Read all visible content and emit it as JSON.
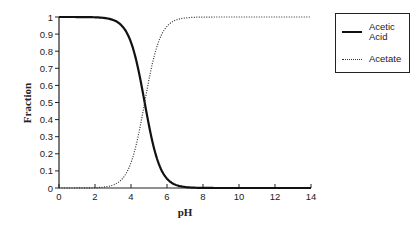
{
  "chart_data": {
    "type": "line",
    "title": "",
    "xlabel": "pH",
    "ylabel": "Fraction",
    "xlim": [
      0,
      14
    ],
    "ylim": [
      0,
      1
    ],
    "xticks": [
      "0",
      "2",
      "4",
      "6",
      "8",
      "10",
      "12",
      "14"
    ],
    "yticks": [
      "0",
      "0.1",
      "0.2",
      "0.3",
      "0.4",
      "0.5",
      "0.6",
      "0.7",
      "0.8",
      "0.9",
      "1"
    ],
    "grid": false,
    "legend_position": "upper right, outside plot",
    "pKa": 4.76,
    "x": [
      0,
      1,
      2,
      2.5,
      3,
      3.5,
      4,
      4.25,
      4.5,
      4.76,
      5,
      5.25,
      5.5,
      6,
      6.5,
      7,
      8,
      10,
      12,
      14
    ],
    "series": [
      {
        "name": "Acetic Acid",
        "style": "solid",
        "values": [
          1.0,
          1.0,
          0.998,
          0.995,
          0.983,
          0.948,
          0.852,
          0.764,
          0.645,
          0.5,
          0.365,
          0.244,
          0.154,
          0.054,
          0.018,
          0.006,
          0.001,
          0.0,
          0.0,
          0.0
        ]
      },
      {
        "name": "Acetate",
        "style": "dotted",
        "values": [
          0.0,
          0.0,
          0.002,
          0.005,
          0.017,
          0.052,
          0.148,
          0.236,
          0.355,
          0.5,
          0.635,
          0.756,
          0.846,
          0.946,
          0.982,
          0.994,
          0.999,
          1.0,
          1.0,
          1.0
        ]
      }
    ]
  },
  "legend": {
    "items": [
      {
        "label_line1": "Acetic",
        "label_line2": "Acid"
      },
      {
        "label_line1": "Acetate"
      }
    ]
  }
}
